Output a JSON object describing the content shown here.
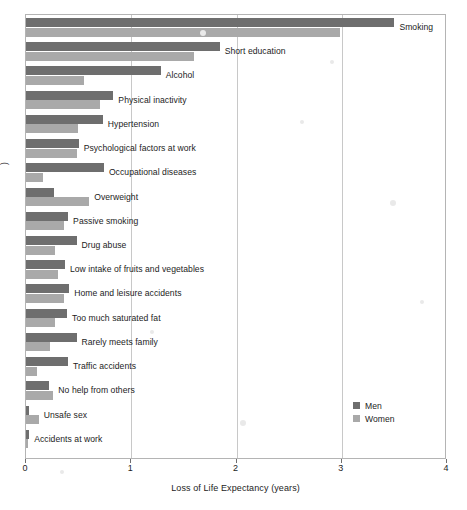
{
  "chart_data": {
    "type": "bar",
    "orientation": "horizontal",
    "title": "",
    "xlabel": "Loss of Life Expectancy (years)",
    "ylabel": "",
    "ylabel_fragment_visible": ")",
    "xlim": [
      0,
      4
    ],
    "xticks": [
      0,
      1,
      2,
      3,
      4
    ],
    "xtick_labels": [
      "0",
      "1",
      "2",
      "3",
      "4"
    ],
    "grid": "vertical",
    "legend_position": "center-right",
    "categories": [
      "Smoking",
      "Short education",
      "Alcohol",
      "Physical inactivity",
      "Hypertension",
      "Psychological factors at work",
      "Occupational diseases",
      "Overweight",
      "Passive smoking",
      "Drug abuse",
      "Low intake of fruits and vegetables",
      "Home and leisure accidents",
      "Too much saturated fat",
      "Rarely meets family",
      "Traffic accidents",
      "No help from others",
      "Unsafe sex",
      "Accidents at work"
    ],
    "series": [
      {
        "name": "Men",
        "color": "#6e6e6e",
        "values": [
          3.5,
          1.84,
          1.28,
          0.83,
          0.73,
          0.5,
          0.74,
          0.27,
          0.4,
          0.48,
          0.37,
          0.41,
          0.39,
          0.48,
          0.4,
          0.22,
          0.03,
          0.03
        ]
      },
      {
        "name": "Women",
        "color": "#a9a9a9",
        "values": [
          2.98,
          1.6,
          0.55,
          0.7,
          0.49,
          0.48,
          0.16,
          0.6,
          0.36,
          0.28,
          0.3,
          0.36,
          0.28,
          0.23,
          0.1,
          0.26,
          0.12,
          0.01
        ]
      }
    ]
  },
  "legend": {
    "items": [
      {
        "label": "Men",
        "color": "#6e6e6e"
      },
      {
        "label": "Women",
        "color": "#a9a9a9"
      }
    ]
  },
  "axis": {
    "x_title": "Loss of Life Expectancy (years)",
    "tick_labels": [
      "0",
      "1",
      "2",
      "3",
      "4"
    ]
  }
}
